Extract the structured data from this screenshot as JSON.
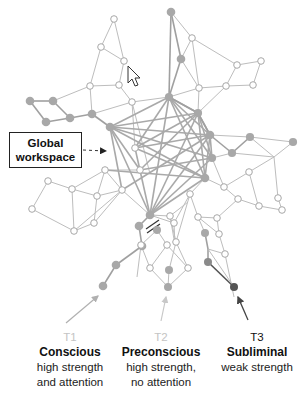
{
  "diagram": {
    "workspace_label": {
      "line1": "Global",
      "line2": "workspace"
    },
    "colors": {
      "active_node": "#a8a8a8",
      "dark_node": "#5a5a5a",
      "inactive_node_fill": "#ffffff",
      "edge": "#b9b9b9",
      "workspace_edge": "#a9a9a9",
      "text": "#111111",
      "faint_text": "#c4c4c4"
    },
    "cursor_icon": "mouse-pointer",
    "targets": [
      {
        "id": "T1",
        "name": "Conscious",
        "desc_line1": "high strength",
        "desc_line2": "and attention",
        "id_color": "faint"
      },
      {
        "id": "T2",
        "name": "Preconscious",
        "desc_line1": "high strength,",
        "desc_line2": "no attention",
        "id_color": "faint"
      },
      {
        "id": "T3",
        "name": "Subliminal",
        "desc_line1": "weak strength",
        "desc_line2": "",
        "id_color": "dark"
      }
    ]
  }
}
